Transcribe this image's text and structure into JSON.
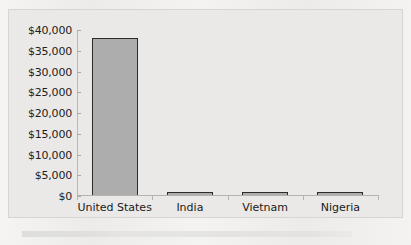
{
  "chart_data": {
    "type": "bar",
    "title": "",
    "subtitle": "",
    "xlabel": "",
    "ylabel": "",
    "categories": [
      "United States",
      "India",
      "Vietnam",
      "Nigeria"
    ],
    "values": [
      38000,
      700,
      600,
      500
    ],
    "ylim": [
      0,
      40000
    ],
    "ytick_values": [
      0,
      5000,
      10000,
      15000,
      20000,
      25000,
      30000,
      35000,
      40000
    ],
    "ytick_labels": [
      "$0",
      "$5,000",
      "$10,000",
      "$15,000",
      "$20,000",
      "$25,000",
      "$30,000",
      "$35,000",
      "$40,000"
    ],
    "grid": false,
    "legend": false,
    "legend_position": "none",
    "annotations": [],
    "colors": {
      "bar_fill": "#adadad",
      "bar_border": "#2b2b2b",
      "axis": "#b4b3b0",
      "text": "#1a1a1a",
      "plot_background": "#eae9e7",
      "page_background": "#efeeec",
      "frame_border": "#d6d5d2"
    }
  }
}
